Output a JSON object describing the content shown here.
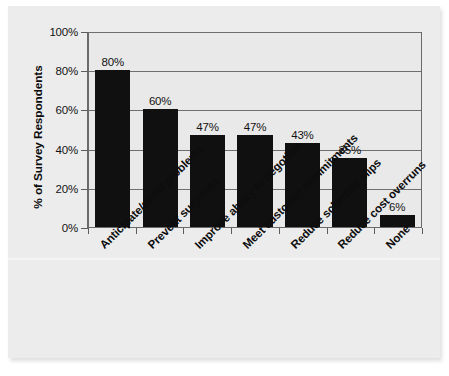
{
  "chart_data": {
    "type": "bar",
    "title": "",
    "subtitle": "",
    "xlabel": "",
    "ylabel": "% of Survey Respondents",
    "categories": [
      "Anticipate/avoid problems",
      "Prevent surprises",
      "Improve ability to negotiate",
      "Meet customer commitments",
      "Reduce schedule slips",
      "Reduce cost overruns",
      "None"
    ],
    "values": [
      80,
      60,
      47,
      47,
      43,
      35,
      6
    ],
    "value_labels": [
      "80%",
      "60%",
      "47%",
      "47%",
      "43%",
      "35%",
      "6%"
    ],
    "ylim": [
      0,
      100
    ],
    "ytick_values": [
      0,
      20,
      40,
      60,
      80,
      100
    ],
    "ytick_labels": [
      "0%",
      "20%",
      "40%",
      "60%",
      "80%",
      "100%"
    ],
    "grid": "horizontal",
    "legend": "none",
    "bar_color": "#101010",
    "plot_background": "#e9e9e9",
    "page_background": "#ececec",
    "axis_color": "#6a6a6a"
  }
}
